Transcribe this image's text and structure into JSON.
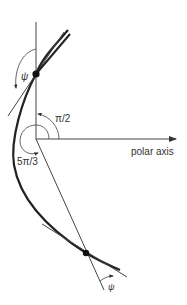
{
  "diagram": {
    "labels": {
      "psi_top": "ψ",
      "psi_bottom": "ψ",
      "half_pi": "π/2",
      "five_pi_third": "5π/3",
      "polar_axis": "polar axis"
    },
    "colors": {
      "ink": "#222222",
      "light_ink": "#555555",
      "background": "#ffffff"
    }
  }
}
